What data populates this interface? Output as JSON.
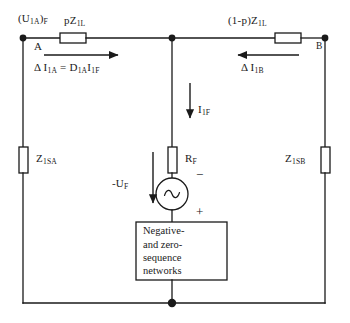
{
  "diagram": {
    "line_color": "#1a1a1a",
    "background": "#ffffff"
  },
  "nodes": {
    "a_label": "A",
    "b_label": "B"
  },
  "labels": {
    "voltage_a": "(U1A)F",
    "impedance_line_left": "pZ1L",
    "impedance_line_right": "(1-p)Z1L",
    "impedance_source_a": "Z1SA",
    "impedance_source_b": "Z1SB",
    "delta_current_a_equation": "Δ I1A = D1AI1F",
    "delta_current_b": "Δ I1B",
    "fault_current": "I1F",
    "fault_resistance": "RF",
    "fault_voltage": "-UF",
    "polarity_minus": "−",
    "polarity_plus": "+"
  },
  "network_box": {
    "lines": [
      "Negative-",
      "and zero-",
      "sequence",
      "networks"
    ]
  },
  "components": {
    "source_symbol": "ac-source-sine",
    "resistor_line_left": "resistor-horizontal",
    "resistor_line_right": "resistor-horizontal",
    "resistor_source_a": "resistor-vertical",
    "resistor_source_b": "resistor-vertical",
    "resistor_fault": "resistor-vertical"
  }
}
